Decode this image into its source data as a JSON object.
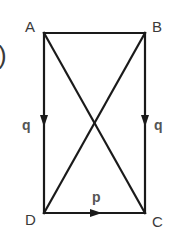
{
  "figure": {
    "partial_label": ")",
    "vertices": {
      "A": {
        "label": "A",
        "x": 44,
        "y": 33
      },
      "B": {
        "label": "B",
        "x": 145,
        "y": 33
      },
      "C": {
        "label": "C",
        "x": 145,
        "y": 213
      },
      "D": {
        "label": "D",
        "x": 44,
        "y": 213
      }
    },
    "edges": [
      {
        "from": "A",
        "to": "B",
        "arrow": false
      },
      {
        "from": "A",
        "to": "D",
        "arrow": true,
        "direction": "down",
        "label": "q"
      },
      {
        "from": "B",
        "to": "C",
        "arrow": true,
        "direction": "down",
        "label": "q"
      },
      {
        "from": "D",
        "to": "C",
        "arrow": true,
        "direction": "right",
        "label": "p"
      },
      {
        "from": "A",
        "to": "C",
        "arrow": false,
        "type": "diagonal"
      },
      {
        "from": "B",
        "to": "D",
        "arrow": false,
        "type": "diagonal"
      }
    ],
    "vector_labels": {
      "left": "q",
      "right": "q",
      "bottom": "p"
    },
    "colors": {
      "line": "#1a1a1a",
      "vertex_text": "#3a3a3a",
      "vector_text": "#555555",
      "background": "#ffffff"
    }
  }
}
